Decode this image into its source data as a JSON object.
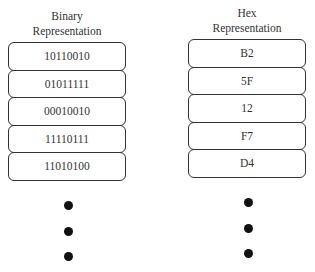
{
  "binary": {
    "title_line1": "Binary",
    "title_line2": "Representation",
    "values": [
      "10110010",
      "01011111",
      "00010010",
      "11110111",
      "11010100"
    ]
  },
  "hex": {
    "title_line1": "Hex",
    "title_line2": "Representation",
    "values": [
      "B2",
      "5F",
      "12",
      "F7",
      "D4"
    ]
  },
  "continuation": "ellipsis-dots"
}
